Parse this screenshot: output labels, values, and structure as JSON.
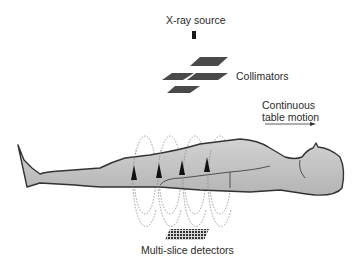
{
  "diagram": {
    "labels": {
      "source": "X-ray source",
      "collimators": "Collimators",
      "motion_line1": "Continuous",
      "motion_line2": "table motion",
      "detectors": "Multi-slice detectors"
    },
    "colors": {
      "body_fill": "#bdbdbd",
      "body_outline": "#333333",
      "collimator": "#4a4a4a",
      "helix": "#777777",
      "arrow": "#111111"
    },
    "helix_loops": 4,
    "collimator_plates": 4
  }
}
